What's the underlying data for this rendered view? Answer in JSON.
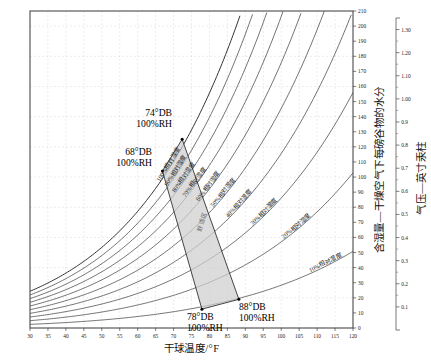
{
  "chart_data": {
    "type": "line",
    "title": "",
    "xlabel": "干球温度/°F",
    "ylabel": "含湿量—干燥空气下每磅谷物的水分",
    "y2label": "气压—英寸汞柱",
    "xlim": [
      30,
      120
    ],
    "ylim": [
      0,
      210
    ],
    "y2lim": [
      0.0,
      1.35
    ],
    "grid": true,
    "legend_position": "inline-curve-labels",
    "xticks": [
      30,
      35,
      40,
      45,
      50,
      55,
      60,
      65,
      70,
      75,
      80,
      85,
      90,
      95,
      100,
      105,
      110,
      115,
      120
    ],
    "yticks": [
      0,
      10,
      20,
      30,
      40,
      50,
      60,
      70,
      80,
      90,
      100,
      110,
      120,
      130,
      140,
      150,
      160,
      170,
      180,
      190,
      200,
      210
    ],
    "y2ticks": [
      "0.1",
      "0.2",
      "0.3",
      "0.4",
      "0.5",
      "0.6",
      "0.7",
      "0.8",
      "0.9",
      "1.00",
      "1.10",
      "1.20",
      "1.30"
    ],
    "series": [
      {
        "name": "100%相对湿度",
        "rh": 100
      },
      {
        "name": "90%相对湿度",
        "rh": 90
      },
      {
        "name": "80%相对湿度",
        "rh": 80
      },
      {
        "name": "70%相对湿度",
        "rh": 70
      },
      {
        "name": "60%相对湿度",
        "rh": 60
      },
      {
        "name": "50%相对湿度",
        "rh": 50
      },
      {
        "name": "40%相对湿度",
        "rh": 40
      },
      {
        "name": "30%相对湿度",
        "rh": 30
      },
      {
        "name": "20%相对湿度",
        "rh": 20
      },
      {
        "name": "10%相对湿度",
        "rh": 10
      }
    ],
    "annotations": [
      {
        "id": "pt-74",
        "line1": "74°DB",
        "line2": "100%RH",
        "db": 74,
        "rh": 100
      },
      {
        "id": "pt-68",
        "line1": "68°DB",
        "line2": "100%RH",
        "db": 68,
        "rh": 100
      },
      {
        "id": "pt-78",
        "line1": "78°DB",
        "line2": "100%RH",
        "db": 78,
        "rh": 100
      },
      {
        "id": "pt-88",
        "line1": "88°DB",
        "line2": "100%RH",
        "db": 88,
        "rh": 100
      }
    ],
    "comfort_zone": {
      "label": "舒适区",
      "fill_color": "#cfcfcf"
    }
  },
  "chart": {
    "xlabel": "干球温度/°F",
    "ylabel": "含湿量—干燥空气下每磅谷物的水分",
    "y2label": "气压—英寸汞柱",
    "zone_label": "舒适区",
    "rh_labels": [
      "100%相对湿度",
      "90%相对湿度",
      "80%相对湿度",
      "70%相对湿度",
      "60%相对湿度",
      "50%相对湿度",
      "40%相对湿度",
      "30%相对湿度",
      "20%相对湿度",
      "10%相对湿度"
    ],
    "points": {
      "p74_l1": "74°DB",
      "p74_l2": "100%RH",
      "p68_l1": "68°DB",
      "p68_l2": "100%RH",
      "p78_l1": "78°DB",
      "p78_l2": "100%RH",
      "p88_l1": "88°DB",
      "p88_l2": "100%RH"
    }
  }
}
